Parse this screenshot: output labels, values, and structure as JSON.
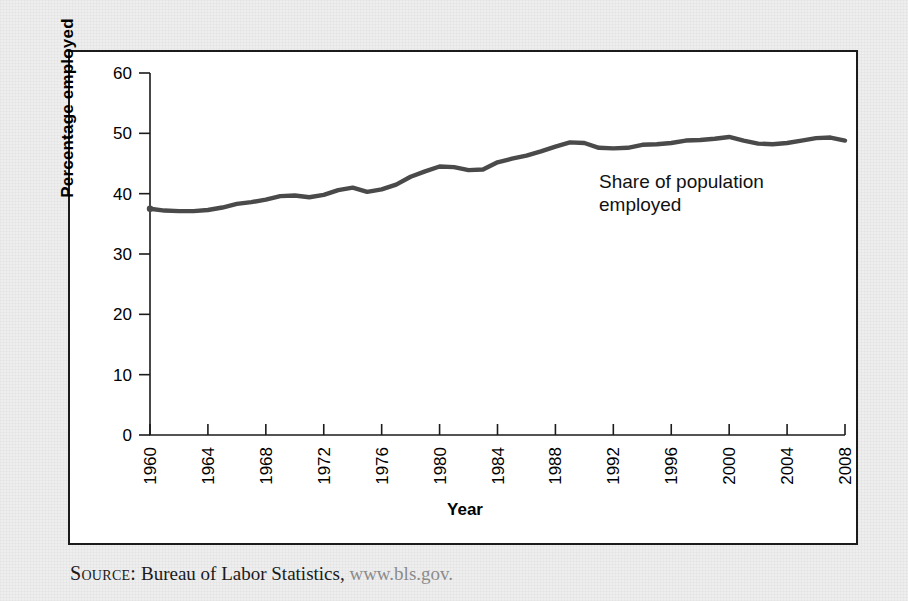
{
  "figure": {
    "source_label": "Source:",
    "source_text": " Bureau of Labor Statistics, ",
    "source_url": "www.bls.gov."
  },
  "chart_data": {
    "type": "line",
    "title": "",
    "xlabel": "Year",
    "ylabel": "Percentage employed",
    "xlim": [
      1960,
      2008
    ],
    "ylim": [
      0,
      60
    ],
    "yticks": [
      0,
      10,
      20,
      30,
      40,
      50,
      60
    ],
    "xticks": [
      1960,
      1964,
      1968,
      1972,
      1976,
      1980,
      1984,
      1988,
      1992,
      1996,
      2000,
      2004,
      2008
    ],
    "grid": false,
    "legend": "none",
    "annotations": [
      {
        "text": "Share of population\nemployed",
        "x": 1992,
        "y": 44
      }
    ],
    "series": [
      {
        "name": "Share of population employed",
        "color": "#4a4a4a",
        "x": [
          1960,
          1961,
          1962,
          1963,
          1964,
          1965,
          1966,
          1967,
          1968,
          1969,
          1970,
          1971,
          1972,
          1973,
          1974,
          1975,
          1976,
          1977,
          1978,
          1979,
          1980,
          1981,
          1982,
          1983,
          1984,
          1985,
          1986,
          1987,
          1988,
          1989,
          1990,
          1991,
          1992,
          1993,
          1994,
          1995,
          1996,
          1997,
          1998,
          1999,
          2000,
          2001,
          2002,
          2003,
          2004,
          2005,
          2006,
          2007,
          2008
        ],
        "values": [
          37.5,
          37.2,
          37.1,
          37.1,
          37.3,
          37.7,
          38.3,
          38.6,
          39.0,
          39.6,
          39.7,
          39.4,
          39.8,
          40.6,
          41.0,
          40.3,
          40.7,
          41.5,
          42.8,
          43.7,
          44.5,
          44.4,
          43.9,
          44.0,
          45.2,
          45.8,
          46.3,
          47.0,
          47.8,
          48.5,
          48.4,
          47.6,
          47.5,
          47.6,
          48.1,
          48.2,
          48.4,
          48.8,
          48.9,
          49.1,
          49.4,
          48.8,
          48.3,
          48.2,
          48.4,
          48.8,
          49.2,
          49.3,
          48.8
        ]
      }
    ]
  }
}
